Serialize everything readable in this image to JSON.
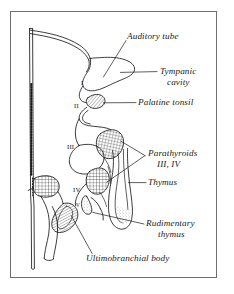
{
  "figure": {
    "frame_color": "#6e6e6e",
    "ink_color": "#1a1a1a",
    "background": "#ffffff"
  },
  "labels": [
    {
      "id": "auditory-tube",
      "text": "Auditory tube",
      "x": 127,
      "y": 36,
      "align": "left"
    },
    {
      "id": "tympanic-cavity-1",
      "text": "Tympanic",
      "x": 160,
      "y": 73,
      "align": "left"
    },
    {
      "id": "tympanic-cavity-2",
      "text": "cavity",
      "x": 167,
      "y": 84,
      "align": "left"
    },
    {
      "id": "palatine-tonsil",
      "text": "Palatine tonsil",
      "x": 138,
      "y": 104,
      "align": "left"
    },
    {
      "id": "parathyroids-1",
      "text": "Parathyroids",
      "x": 148,
      "y": 155,
      "align": "left"
    },
    {
      "id": "parathyroids-2",
      "text": "III, IV",
      "x": 157,
      "y": 166,
      "align": "left"
    },
    {
      "id": "thymus",
      "text": "Thymus",
      "x": 148,
      "y": 184,
      "align": "left"
    },
    {
      "id": "rudimentary-thymus-1",
      "text": "Rudimentary",
      "x": 146,
      "y": 225,
      "align": "left"
    },
    {
      "id": "rudimentary-thymus-2",
      "text": "thymus",
      "x": 158,
      "y": 236,
      "align": "left"
    },
    {
      "id": "ultimobranchial-body",
      "text": "Ultimobranchial body",
      "x": 86,
      "y": 260,
      "align": "left"
    }
  ],
  "pouch_numerals": [
    {
      "id": "pouch-I",
      "text": "I",
      "x": 81,
      "y": 83,
      "size": "normal"
    },
    {
      "id": "pouch-II",
      "text": "II",
      "x": 74,
      "y": 106,
      "size": "normal"
    },
    {
      "id": "pouch-III",
      "text": "III",
      "x": 67,
      "y": 147,
      "size": "normal"
    },
    {
      "id": "pouch-IV",
      "text": "IV",
      "x": 73,
      "y": 190,
      "size": "normal"
    },
    {
      "id": "pouch-V",
      "text": "V",
      "x": 76,
      "y": 205,
      "size": "tiny"
    }
  ],
  "structures": [
    {
      "id": "pharynx-outline",
      "fill": "none",
      "note": "central pharyngeal wall contour"
    },
    {
      "id": "auditory-tube-lobe",
      "fill": "none",
      "note": "pouch I derivative, tympanic cavity and tube"
    },
    {
      "id": "palatine-tonsil-mass",
      "fill": "hatch-diag",
      "note": "pouch II derivative, diagonal hatching"
    },
    {
      "id": "parathyroid-III",
      "fill": "crosshatch",
      "note": "pouch III dorsal, cross hatched"
    },
    {
      "id": "parathyroid-IV",
      "fill": "crosshatch",
      "note": "pouch IV dorsal, cross hatched"
    },
    {
      "id": "parathyroid-lateral",
      "fill": "crosshatch",
      "note": "left lateral cross hatched mass"
    },
    {
      "id": "thymus-tube",
      "fill": "stipple",
      "note": "elongate descending thymus primordium"
    },
    {
      "id": "rudimentary-thymus",
      "fill": "stipple",
      "note": "small rudimentary thymus bud"
    },
    {
      "id": "ultimobranchial",
      "fill": "hatch-horiz",
      "note": "pouch V ultimobranchial body, line hatching"
    },
    {
      "id": "neural-axis-line",
      "fill": "dashed",
      "note": "vertical dashed midline axis at left"
    }
  ],
  "leader_lines": [
    {
      "id": "leader-auditory-tube",
      "from": "auditory-tube",
      "to": "auditory-tube-lobe"
    },
    {
      "id": "leader-tympanic-cavity",
      "from": "tympanic-cavity-1",
      "to": "auditory-tube-lobe"
    },
    {
      "id": "leader-palatine-tonsil",
      "from": "palatine-tonsil",
      "to": "palatine-tonsil-mass"
    },
    {
      "id": "leader-parathyroid-upper",
      "from": "parathyroids-1",
      "to": "parathyroid-III"
    },
    {
      "id": "leader-parathyroid-lower",
      "from": "parathyroids-1",
      "to": "parathyroid-IV"
    },
    {
      "id": "leader-thymus",
      "from": "thymus",
      "to": "thymus-tube"
    },
    {
      "id": "leader-rudimentary-thymus",
      "from": "rudimentary-thymus-1",
      "to": "rudimentary-thymus"
    },
    {
      "id": "leader-ultimobranchial-body",
      "from": "ultimobranchial-body",
      "to": "ultimobranchial"
    }
  ]
}
